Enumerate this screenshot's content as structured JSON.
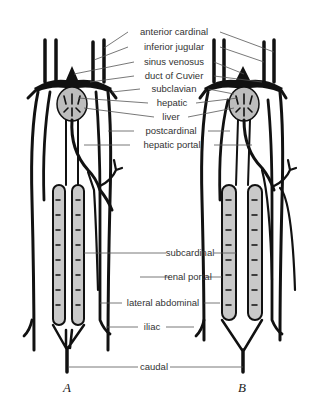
{
  "figure": {
    "panels": [
      {
        "id": "A",
        "caption": "A"
      },
      {
        "id": "B",
        "caption": "B"
      }
    ],
    "labels": [
      {
        "key": "anterior_cardinal",
        "text": "anterior cardinal",
        "y": 32
      },
      {
        "key": "inferior_jugular",
        "text": "inferior jugular",
        "y": 47
      },
      {
        "key": "sinus_venosus",
        "text": "sinus venosus",
        "y": 62
      },
      {
        "key": "duct_of_cuvier",
        "text": "duct of Cuvier",
        "y": 76
      },
      {
        "key": "subclavian",
        "text": "subclavian",
        "y": 89
      },
      {
        "key": "hepatic",
        "text": "hepatic",
        "y": 103
      },
      {
        "key": "liver",
        "text": "liver",
        "y": 117
      },
      {
        "key": "postcardinal",
        "text": "postcardinal",
        "y": 131
      },
      {
        "key": "hepatic_portal",
        "text": "hepatic portal",
        "y": 145
      },
      {
        "key": "subcardinal",
        "text": "subcardinal",
        "y": 253
      },
      {
        "key": "renal_portal",
        "text": "renal portal",
        "y": 277
      },
      {
        "key": "lateral_abdominal",
        "text": "lateral abdominal",
        "y": 303
      },
      {
        "key": "iliac",
        "text": "iliac",
        "y": 327
      },
      {
        "key": "caudal",
        "text": "caudal",
        "y": 367
      }
    ],
    "colors": {
      "ink": "#111111",
      "stipple": "#c9c9c9",
      "label": "#333333",
      "background": "#ffffff"
    }
  }
}
